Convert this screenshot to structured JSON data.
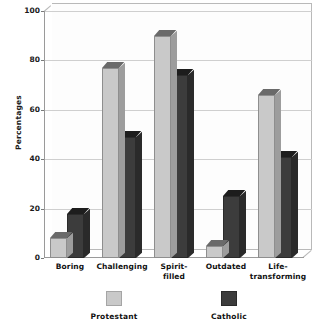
{
  "top_strip_text": "",
  "chart_data": {
    "type": "bar",
    "title": "",
    "xlabel": "",
    "ylabel": "Percentages",
    "ylim": [
      0,
      100
    ],
    "yticks": [
      0,
      20,
      40,
      60,
      80,
      100
    ],
    "ytick_labels": [
      "0",
      "20",
      "40",
      "60",
      "80",
      "100"
    ],
    "grid": true,
    "legend_position": "bottom",
    "categories": [
      "Boring",
      "Challenging",
      "Spirit-\nfilled",
      "Outdated",
      "Life-\ntransforming"
    ],
    "category_lines": [
      [
        "Boring"
      ],
      [
        "Challenging"
      ],
      [
        "Spirit-",
        "filled"
      ],
      [
        "Outdated"
      ],
      [
        "Life-",
        "transforming"
      ]
    ],
    "series": [
      {
        "name": "Protestant",
        "color": "#c9c9c9",
        "values": [
          8,
          77,
          90,
          5,
          66
        ]
      },
      {
        "name": "Catholic",
        "color": "#3c3c3c",
        "values": [
          18,
          49,
          74,
          25,
          41
        ]
      }
    ]
  },
  "legend": {
    "entries": [
      {
        "label": "Protestant",
        "swatch": "sw-protestant"
      },
      {
        "label": "Catholic",
        "swatch": "sw-catholic"
      }
    ]
  },
  "colors": {
    "protestant": "#c9c9c9",
    "catholic": "#3c3c3c",
    "gridline": "#cfcfcf",
    "axis": "#9a9a9a",
    "background": "#ffffff"
  }
}
